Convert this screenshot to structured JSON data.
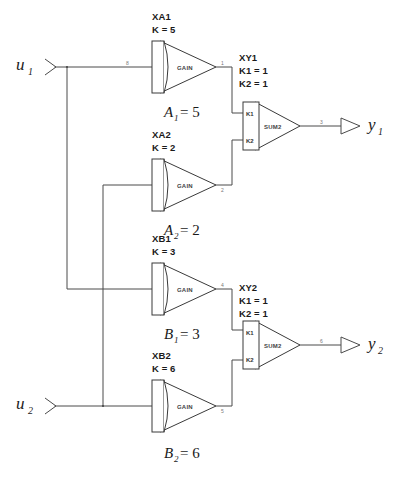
{
  "diagram": {
    "inputs": [
      {
        "id": "u1",
        "label": "u",
        "subscript": "1"
      },
      {
        "id": "u2",
        "label": "u",
        "subscript": "2"
      }
    ],
    "outputs": [
      {
        "id": "y1",
        "label": "y",
        "subscript": "1"
      },
      {
        "id": "y2",
        "label": "y",
        "subscript": "2"
      }
    ],
    "gain_blocks": [
      {
        "id": "XA1",
        "name": "XA1",
        "param": "K = 5",
        "inner_label": "GAIN",
        "caption_sym": "A",
        "caption_sub": "1",
        "caption_eq": "= 5",
        "in_signal": "8",
        "out_signal": "1"
      },
      {
        "id": "XA2",
        "name": "XA2",
        "param": "K = 2",
        "inner_label": "GAIN",
        "caption_sym": "A",
        "caption_sub": "2",
        "caption_eq": "= 2",
        "in_signal": "",
        "out_signal": "2"
      },
      {
        "id": "XB1",
        "name": "XB1",
        "param": "K = 3",
        "inner_label": "GAIN",
        "caption_sym": "B",
        "caption_sub": "1",
        "caption_eq": "= 3",
        "in_signal": "",
        "out_signal": "4"
      },
      {
        "id": "XB2",
        "name": "XB2",
        "param": "K = 6",
        "inner_label": "GAIN",
        "caption_sym": "B",
        "caption_sub": "2",
        "caption_eq": "= 6",
        "in_signal": "",
        "out_signal": "5"
      }
    ],
    "sum_blocks": [
      {
        "id": "XY1",
        "name": "XY1",
        "param1": "K1 = 1",
        "param2": "K2 = 1",
        "inner_label": "SUM2",
        "port1": "K1",
        "port2": "K2",
        "out_signal": "3"
      },
      {
        "id": "XY2",
        "name": "XY2",
        "param1": "K1 = 1",
        "param2": "K2 = 1",
        "inner_label": "SUM2",
        "port1": "K1",
        "port2": "K2",
        "out_signal": "6"
      }
    ],
    "colors": {
      "wire": "#4a4a4a",
      "outline": "#3a3a3a",
      "text": "#1a1a1a",
      "background": "#ffffff"
    }
  }
}
